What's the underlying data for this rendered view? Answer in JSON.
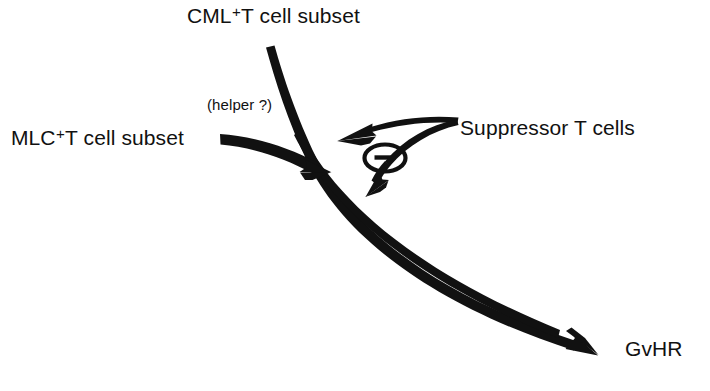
{
  "figure": {
    "background_color": "#ffffff",
    "ink_color": "#111111"
  },
  "labels": {
    "cml_subset": {
      "prefix": "CML",
      "superscript": "+",
      "suffix": "T cell subset",
      "full": "CML+T cell subset"
    },
    "mlc_subset": {
      "prefix": "MLC",
      "superscript": "+",
      "suffix": "T cell subset",
      "full": "MLC+T cell subset"
    },
    "helper_annotation": "(helper ?)",
    "suppressor_cells": "Suppressor T cells",
    "outcome": "GvHR"
  },
  "symbols": {
    "inhibition": {
      "name": "circled-minus",
      "glyph": "⊖",
      "meaning": "inhibition / negative regulation"
    }
  },
  "arrows": [
    {
      "name": "main-pathway-arrow",
      "from": "CML+T cell subset",
      "to": "GvHR",
      "style": "thick tapering curve, arrowhead at GvHR"
    },
    {
      "name": "helper-arrow",
      "from": "MLC+T cell subset",
      "to": "main-pathway",
      "style": "thick tapering curve, arrowhead at junction",
      "annotation": "(helper ?)"
    },
    {
      "name": "suppressor-arrow-upper",
      "from": "Suppressor T cells",
      "to": "helper-arrow junction",
      "style": "thin tapering curve, arrowhead pointing left"
    },
    {
      "name": "suppressor-arrow-lower",
      "from": "Suppressor T cells",
      "to": "main-pathway below junction",
      "style": "thin tapering curve, arrowhead pointing down-left"
    }
  ]
}
